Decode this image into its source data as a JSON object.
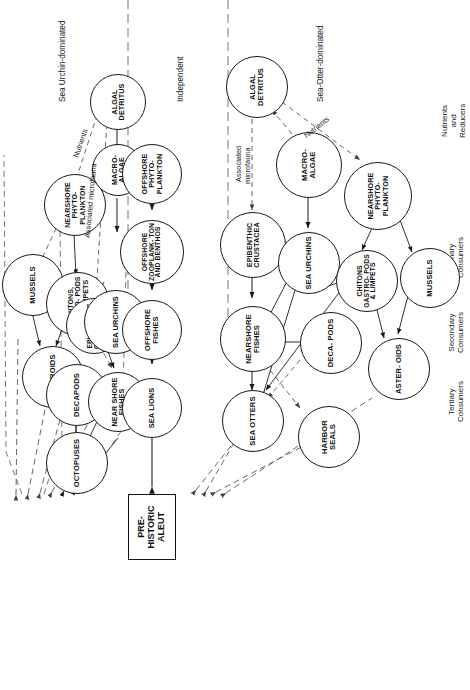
{
  "figure": {
    "center_box": {
      "label": "PRE-HISTORIC ALEUT"
    },
    "bands": [
      {
        "id": "sea-urchin-dominated",
        "label": "Sea Urchin-dominated"
      },
      {
        "id": "independent",
        "label": "Independent"
      },
      {
        "id": "sea-otter-dominated",
        "label": "Sea-Otter-dominated"
      }
    ],
    "trophic_levels": [
      {
        "id": "tertiary",
        "line1": "Tertiary",
        "line2": "Consumers"
      },
      {
        "id": "secondary",
        "line1": "Secondary",
        "line2": "Consumers"
      },
      {
        "id": "primary",
        "line1": "Primary",
        "line2": "Consumers"
      },
      {
        "id": "nutrients",
        "line1": "Nutrients",
        "line2": "and",
        "line3": "Reducers"
      }
    ],
    "edge_labels": [
      {
        "id": "assoc-microfauna-top",
        "text": "Associated microfauna"
      },
      {
        "id": "nutrients-top",
        "text": "Nutrients"
      },
      {
        "id": "assoc-microfauna-bottom-1",
        "text": "Associated"
      },
      {
        "id": "assoc-microfauna-bottom-2",
        "text": "microfauna"
      },
      {
        "id": "nutrients-bottom",
        "text": "Nutrients"
      }
    ],
    "nodes_urchin": [
      {
        "id": "u-mussels",
        "label": "MUSSELS"
      },
      {
        "id": "u-asteroids",
        "label": "ASTEROIDS"
      },
      {
        "id": "u-chitons",
        "label": "CHITONS, GASTRO- PODS AND LIMPETS"
      },
      {
        "id": "u-octopuses",
        "label": "OCTOPUSES"
      },
      {
        "id": "u-decapods",
        "label": "DECAPODS"
      },
      {
        "id": "u-epibenthic",
        "label": "EPI- BENTHIC CRUSTA- CEA"
      },
      {
        "id": "u-nearshore-phyto",
        "label": "NEARSHORE PHYTO- PLANKTON"
      },
      {
        "id": "u-nearshore-fishes",
        "label": "NEAR SHORE FISHES"
      },
      {
        "id": "u-sea-urchins",
        "label": "SEA URCHINS"
      },
      {
        "id": "u-macroalgae",
        "label": "MACRO- ALGAE"
      },
      {
        "id": "u-algal-detritus",
        "label": "ALGAL DETRITUS"
      }
    ],
    "nodes_independent": [
      {
        "id": "i-sea-lions",
        "label": "SEA LIONS"
      },
      {
        "id": "i-offshore-fishes",
        "label": "OFFSHORE FISHES"
      },
      {
        "id": "i-offshore-zoo",
        "label": "OFFSHORE ZOOPLANK- TON AND BENTHOS"
      },
      {
        "id": "i-offshore-phyto",
        "label": "OFFSHORE PHYTO- PLANKTON"
      }
    ],
    "nodes_otter": [
      {
        "id": "o-sea-otters",
        "label": "SEA OTTERS"
      },
      {
        "id": "o-harbor-seals",
        "label": "HARBOR SEALS"
      },
      {
        "id": "o-nearshore-fishes",
        "label": "NEARSHORE FISHES"
      },
      {
        "id": "o-decapods",
        "label": "DECA- PODS"
      },
      {
        "id": "o-asteroids",
        "label": "ASTER- OIDS"
      },
      {
        "id": "o-epibenthic",
        "label": "EPIBENTHIC CRUSTACEA"
      },
      {
        "id": "o-sea-urchins",
        "label": "SEA URCHINS"
      },
      {
        "id": "o-chitons",
        "label": "CHITONS GASTRO- PODS & LIMPETS"
      },
      {
        "id": "o-mussels",
        "label": "MUSSELS"
      },
      {
        "id": "o-macroalgae",
        "label": "MACRO- ALGAE"
      },
      {
        "id": "o-nearshore-phyto",
        "label": "NEARSHORE PHYTO- PLANKTON"
      },
      {
        "id": "o-algal-detritus",
        "label": "ALGAL DETRITUS"
      }
    ],
    "colors": {
      "stroke": "#1a1a1a",
      "background": "#ffffff",
      "dashed": "#555555"
    }
  }
}
